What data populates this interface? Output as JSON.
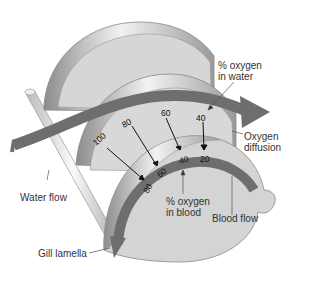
{
  "labels": {
    "oxygen_in_water_line1": "% oxygen",
    "oxygen_in_water_line2": "in water",
    "oxygen_diffusion_line1": "Oxygen",
    "oxygen_diffusion_line2": "diffusion",
    "water_flow": "Water flow",
    "oxygen_in_blood_line1": "% oxygen",
    "oxygen_in_blood_line2": "in blood",
    "blood_flow": "Blood flow",
    "gill_lamella": "Gill lamella"
  },
  "water_values": [
    "100",
    "80",
    "60",
    "40"
  ],
  "blood_values": [
    "80",
    "60",
    "40",
    "20"
  ],
  "colors": {
    "lamella_fill": "#d4d4d4",
    "lamella_edge": "#9a9a9a",
    "arrow_band": "#6e6e6e",
    "text": "#333333"
  }
}
